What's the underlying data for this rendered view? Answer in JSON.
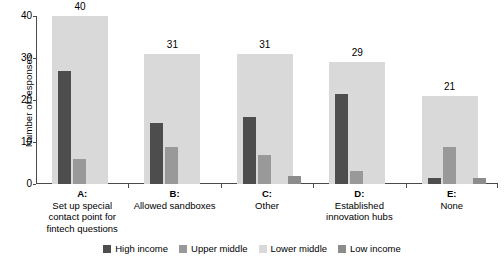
{
  "chart_data": {
    "type": "bar",
    "title": "",
    "subtitle": "",
    "xlabel": "",
    "ylabel": "Number of responses",
    "ylim": [
      0,
      40
    ],
    "yticks": [
      "0",
      "10",
      "20",
      "30",
      "40"
    ],
    "grid": false,
    "legend_position": "bottom",
    "categories": [
      "A: Set up special contact point for fintech questions",
      "B: Allowed sandboxes",
      "C: Other",
      "D: Established innovation hubs",
      "E: None"
    ],
    "category_keys": [
      "A:",
      "B:",
      "C:",
      "D:",
      "E:"
    ],
    "category_names": [
      "Set up special contact point for fintech questions",
      "Allowed sandboxes",
      "Other",
      "Established innovation hubs",
      "None"
    ],
    "series": [
      {
        "name": "High income",
        "color": "#4d4d4d",
        "values": [
          27,
          14.5,
          16,
          21.5,
          1.5
        ]
      },
      {
        "name": "Upper middle",
        "color": "#999999",
        "values": [
          6,
          8.7,
          7,
          3,
          8.7
        ]
      },
      {
        "name": "Lower middle",
        "color": "#d9d9d9",
        "values": [
          40,
          31,
          31,
          29,
          21
        ]
      },
      {
        "name": "Low income",
        "color": "#8c8c8c",
        "values": [
          0,
          0,
          2,
          0,
          1.5
        ]
      }
    ],
    "bar_labels": [
      "40",
      "31",
      "31",
      "29",
      "21"
    ],
    "bar_label_series": "Lower middle"
  },
  "legend": {
    "items": [
      {
        "label": "High income",
        "color": "#4d4d4d"
      },
      {
        "label": "Upper middle",
        "color": "#999999"
      },
      {
        "label": "Lower middle",
        "color": "#d9d9d9"
      },
      {
        "label": "Low income",
        "color": "#8c8c8c"
      }
    ]
  }
}
